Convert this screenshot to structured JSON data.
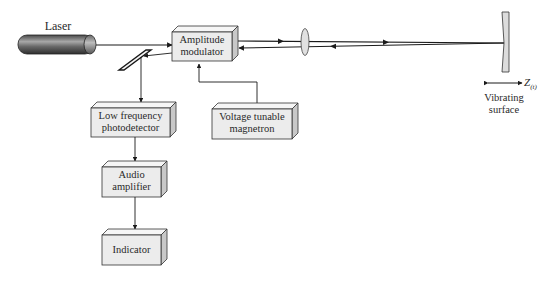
{
  "diagram": {
    "type": "laser vibrometer block diagram",
    "components": {
      "laser": {
        "label": "Laser"
      },
      "modulator": {
        "label_line1": "Amplitude",
        "label_line2": "modulator"
      },
      "photodetector": {
        "label_line1": "Low frequency",
        "label_line2": "photodetector"
      },
      "magnetron": {
        "label_line1": "Voltage tunable",
        "label_line2": "magnetron"
      },
      "amplifier": {
        "label_line1": "Audio",
        "label_line2": "amplifier"
      },
      "indicator": {
        "label": "Indicator"
      },
      "surface": {
        "label_line1": "Vibrating",
        "label_line2": "surface",
        "displacement_symbol": "Z",
        "displacement_subscript": "(t)"
      }
    },
    "colors": {
      "box_face": "#ececec",
      "box_top": "#f6f6f6",
      "box_side": "#c8c8c8",
      "line": "#1a1a1a",
      "laser_dark": "#3a3a3a",
      "laser_light": "#9a9a9a"
    }
  }
}
